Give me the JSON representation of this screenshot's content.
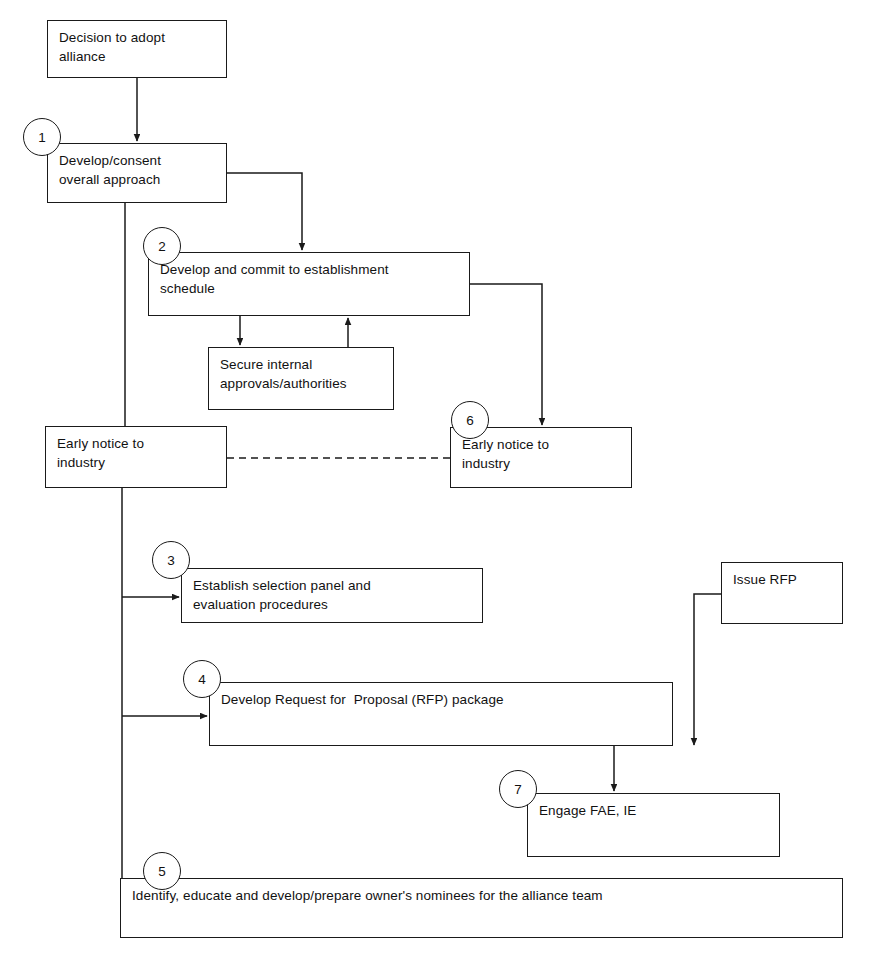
{
  "diagram": {
    "line_color": "#1a1a1a",
    "background": "#ffffff",
    "nodes": [
      {
        "id": "decision",
        "label": "Decision to adopt\nalliance",
        "x": 47,
        "y": 20,
        "w": 180,
        "h": 58
      },
      {
        "id": "develop-consent",
        "label": "Develop/consent\noverall approach",
        "x": 47,
        "y": 143,
        "w": 180,
        "h": 60
      },
      {
        "id": "establish-sched",
        "label": "Develop and commit to establishment\nschedule",
        "x": 148,
        "y": 252,
        "w": 322,
        "h": 64
      },
      {
        "id": "secure-internal",
        "label": "Secure internal\napprovals/authorities",
        "x": 208,
        "y": 347,
        "w": 186,
        "h": 63
      },
      {
        "id": "early-notice-a",
        "label": "Early notice to\nindustry",
        "x": 45,
        "y": 426,
        "w": 182,
        "h": 62
      },
      {
        "id": "early-notice-b",
        "label": "Early notice to\nindustry",
        "x": 450,
        "y": 427,
        "w": 182,
        "h": 61
      },
      {
        "id": "issue-rfp",
        "label": "Issue RFP",
        "x": 721,
        "y": 562,
        "w": 122,
        "h": 62
      },
      {
        "id": "selection-panel",
        "label": "Establish selection panel and\nevaluation procedures",
        "x": 181,
        "y": 568,
        "w": 302,
        "h": 55
      },
      {
        "id": "rfp-package",
        "label": "Develop Request for  Proposal (RFP) package",
        "x": 209,
        "y": 682,
        "w": 464,
        "h": 64
      },
      {
        "id": "engage-fae",
        "label": "Engage FAE, IE",
        "x": 527,
        "y": 793,
        "w": 253,
        "h": 64
      },
      {
        "id": "owner-nominees",
        "label": "Identify, educate and develop/prepare owner's nominees for the alliance team",
        "x": 120,
        "y": 878,
        "w": 723,
        "h": 60
      }
    ],
    "markers": [
      {
        "id": "marker-1",
        "label": "1",
        "cx": 42,
        "cy": 137,
        "d": 38
      },
      {
        "id": "marker-2",
        "label": "2",
        "cx": 162,
        "cy": 246,
        "d": 38
      },
      {
        "id": "marker-6",
        "label": "6",
        "cx": 470,
        "cy": 420,
        "d": 38
      },
      {
        "id": "marker-3",
        "label": "3",
        "cx": 171,
        "cy": 560,
        "d": 38
      },
      {
        "id": "marker-4",
        "label": "4",
        "cx": 202,
        "cy": 679,
        "d": 38
      },
      {
        "id": "marker-7",
        "label": "7",
        "cx": 518,
        "cy": 789,
        "d": 38
      },
      {
        "id": "marker-5",
        "label": "5",
        "cx": 162,
        "cy": 871,
        "d": 38
      }
    ],
    "edges": [
      {
        "id": "edge-decision-to-develop",
        "style": "solid",
        "arrow": true,
        "points": "137,78 137,141"
      },
      {
        "id": "edge-develop-to-schedule",
        "style": "solid",
        "arrow": true,
        "points": "227,173 302,173 302,250"
      },
      {
        "id": "edge-develop-spine-down",
        "style": "solid",
        "arrow": false,
        "points": "125,203 125,426"
      },
      {
        "id": "edge-schedule-to-secure",
        "style": "solid",
        "arrow": true,
        "points": "240,316 240,345"
      },
      {
        "id": "edge-secure-to-schedule",
        "style": "solid",
        "arrow": true,
        "points": "348,347 348,318"
      },
      {
        "id": "edge-schedule-to-notice-b",
        "style": "solid",
        "arrow": true,
        "points": "470,284 542,284 542,425"
      },
      {
        "id": "edge-notice-link",
        "style": "dashed",
        "arrow": false,
        "points": "227,458 450,458"
      },
      {
        "id": "edge-notice-a-spine",
        "style": "solid",
        "arrow": false,
        "points": "122,488 122,912"
      },
      {
        "id": "edge-spine-to-panel",
        "style": "solid",
        "arrow": true,
        "points": "122,597 179,597"
      },
      {
        "id": "edge-spine-to-rfp",
        "style": "solid",
        "arrow": true,
        "points": "122,716 207,716"
      },
      {
        "id": "edge-spine-to-nominees",
        "style": "solid",
        "arrow": true,
        "points": "122,912 168,912"
      },
      {
        "id": "edge-issue-rfp-down",
        "style": "solid",
        "arrow": true,
        "points": "721,594 694,594 694,745"
      },
      {
        "id": "edge-rfp-to-engage",
        "style": "solid",
        "arrow": true,
        "points": "614,746 614,791"
      }
    ]
  }
}
